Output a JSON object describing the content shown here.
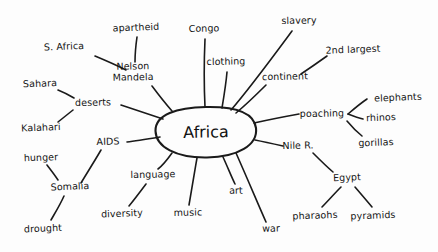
{
  "diagram": {
    "type": "mind-map",
    "title_visible": false,
    "background_color": "#fdfdfd",
    "ink_color": "#1a1a1a",
    "center": {
      "label": "Africa",
      "shape": "ellipse",
      "cx": 206,
      "cy": 132,
      "rx": 50,
      "ry": 25
    },
    "branches": [
      {
        "label": "Nelson\nMandela",
        "line1": "Nelson",
        "line2": "Mandela",
        "x": 133,
        "y": 72
      },
      {
        "label": "Congo",
        "x": 204,
        "y": 29
      },
      {
        "label": "clothing",
        "x": 226,
        "y": 62
      },
      {
        "label": "slavery",
        "x": 299,
        "y": 21
      },
      {
        "label": "continent",
        "x": 285,
        "y": 77
      },
      {
        "label": "poaching",
        "x": 322,
        "y": 114
      },
      {
        "label": "Nile R.",
        "x": 298,
        "y": 146
      },
      {
        "label": "war",
        "x": 271,
        "y": 229
      },
      {
        "label": "art",
        "x": 236,
        "y": 191
      },
      {
        "label": "music",
        "x": 188,
        "y": 213
      },
      {
        "label": "language",
        "x": 153,
        "y": 175
      },
      {
        "label": "AIDS",
        "x": 108,
        "y": 142
      },
      {
        "label": "deserts",
        "x": 93,
        "y": 103
      }
    ],
    "sub_branches": [
      {
        "label": "apartheid",
        "x": 136,
        "y": 28,
        "parent": "Nelson Mandela"
      },
      {
        "label": "S. Africa",
        "x": 64,
        "y": 47,
        "parent": "Nelson Mandela"
      },
      {
        "label": "2nd largest",
        "x": 353,
        "y": 50,
        "parent": "continent"
      },
      {
        "label": "elephants",
        "x": 398,
        "y": 98,
        "parent": "poaching"
      },
      {
        "label": "rhinos",
        "x": 381,
        "y": 118,
        "parent": "poaching"
      },
      {
        "label": "gorillas",
        "x": 376,
        "y": 143,
        "parent": "poaching"
      },
      {
        "label": "Egypt",
        "x": 347,
        "y": 178,
        "parent": "Nile R."
      },
      {
        "label": "pharaohs",
        "x": 315,
        "y": 216,
        "parent": "Egypt"
      },
      {
        "label": "pyramids",
        "x": 373,
        "y": 216,
        "parent": "Egypt"
      },
      {
        "label": "diversity",
        "x": 122,
        "y": 214,
        "parent": "language"
      },
      {
        "label": "Somalia",
        "x": 70,
        "y": 187,
        "parent": "AIDS"
      },
      {
        "label": "hunger",
        "x": 41,
        "y": 158,
        "parent": "Somalia"
      },
      {
        "label": "drought",
        "x": 43,
        "y": 229,
        "parent": "Somalia"
      },
      {
        "label": "Sahara",
        "x": 40,
        "y": 84,
        "parent": "deserts"
      },
      {
        "label": "Kalahari",
        "x": 41,
        "y": 128,
        "parent": "deserts"
      }
    ]
  }
}
